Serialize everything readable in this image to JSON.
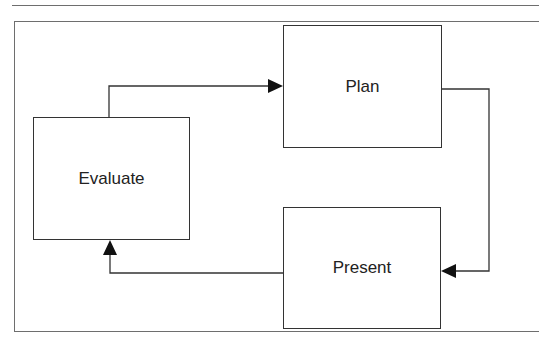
{
  "diagram": {
    "type": "cycle",
    "nodes": [
      {
        "id": "plan",
        "label": "Plan"
      },
      {
        "id": "present",
        "label": "Present"
      },
      {
        "id": "evaluate",
        "label": "Evaluate"
      }
    ],
    "edges": [
      {
        "from": "evaluate",
        "to": "plan"
      },
      {
        "from": "plan",
        "to": "present"
      },
      {
        "from": "present",
        "to": "evaluate"
      }
    ],
    "colors": {
      "stroke": "#333333",
      "frame": "#6e6e6e",
      "background": "#ffffff"
    }
  }
}
